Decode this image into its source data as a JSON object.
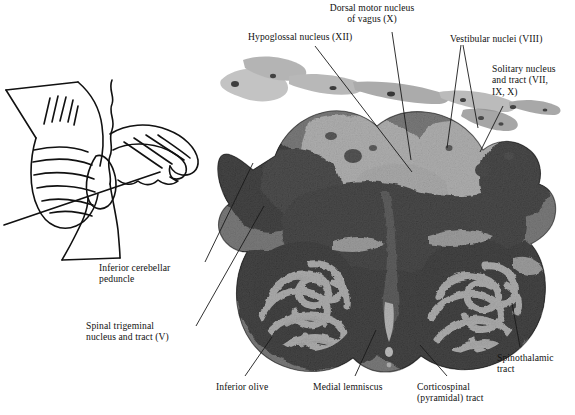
{
  "figure": {
    "type": "labeled-anatomical-figure",
    "stain": "myelin-stained histological section",
    "background_color": "#ffffff",
    "text_color": "#111111",
    "leader_line_color": "#1a1a1a"
  },
  "inset": {
    "name": "sagittal-brainstem-cerebellum-outline",
    "description": "line drawing of cerebellum and brainstem with plane-of-section line",
    "stroke_color": "#111111"
  },
  "labels": {
    "hypoglossal": "Hypoglossal nucleus (XII)",
    "dorsal_motor_vagus": "Dorsal motor nucleus\nof vagus (X)",
    "vestibular": "Vestibular nuclei (VIII)",
    "solitary": "Solitary nucleus\nand tract (VII,\nIX, X)",
    "inferior_cerebellar_peduncle": "Inferior cerebellar\npeduncle",
    "spinal_trigeminal": "Spinal trigeminal\nnucleus and tract (V)",
    "inferior_olive": "Inferior olive",
    "medial_lemniscus": "Medial lemniscus",
    "corticospinal": "Corticospinal\n(pyramidal) tract",
    "spinothalamic": "Spinothalamic\ntract"
  }
}
